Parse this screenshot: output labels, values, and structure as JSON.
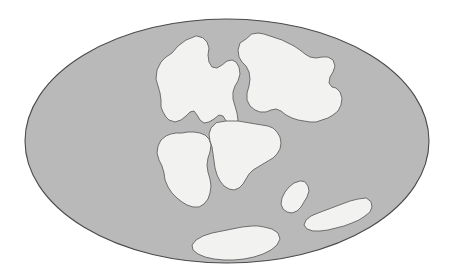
{
  "figure": {
    "caption": "",
    "projection": "elliptical (Mollweide-style) world projection",
    "width": 453,
    "height": 276
  },
  "colors": {
    "page_background": "#ffffff",
    "ocean_fill": "#b9b9b9",
    "ocean_outline": "#4a4a4a",
    "land_fill": "#f2f2f0",
    "land_outline": "#6e6e6e"
  },
  "style": {
    "ocean_stroke_width": 1.1,
    "land_stroke_width": 1.0
  },
  "map": {
    "ocean": {
      "name": "world-ocean",
      "label": "Ocean",
      "ellipse": {
        "cx": 227,
        "cy": 141,
        "rx": 202,
        "ry": 122
      }
    },
    "landmasses": [
      {
        "id": "laurentia-north-america",
        "label": "North America (Laurentia)",
        "path": "M 196 36 L 186 40 L 178 46 L 172 53 L 166 57 L 161 62 L 157 70 L 156 79 L 158 86 L 160 93 L 161 100 L 161 107 L 163 112 L 166 117 L 169 120 L 175 122 L 181 120 L 186 116 L 190 112 L 194 111 L 197 115 L 200 120 L 204 123 L 209 122 L 214 119 L 219 115 L 223 116 L 226 121 L 231 124 L 236 125 L 238 120 L 237 113 L 235 106 L 233 99 L 233 92 L 235 86 L 238 81 L 240 74 L 239 67 L 236 62 L 232 60 L 227 61 L 222 65 L 217 68 L 212 67 L 209 62 L 208 55 L 209 48 L 207 42 L 203 38 Z"
      },
      {
        "id": "eurasia-laurasia",
        "label": "Eurasia (Laurasia)",
        "path": "M 246 39 L 240 43 L 238 50 L 239 57 L 242 62 L 246 66 L 249 72 L 250 79 L 249 86 L 247 93 L 247 100 L 250 106 L 255 110 L 260 112 L 266 112 L 271 110 L 276 109 L 281 111 L 286 115 L 292 118 L 298 120 L 304 121 L 310 122 L 316 122 L 322 120 L 328 118 L 333 115 L 338 111 L 341 105 L 342 98 L 340 92 L 336 88 L 332 87 L 329 83 L 330 77 L 333 72 L 335 66 L 333 60 L 328 57 L 322 57 L 316 58 L 310 57 L 305 54 L 300 50 L 294 46 L 288 43 L 282 40 L 276 38 L 270 36 L 264 34 L 258 33 L 252 34 Z"
      },
      {
        "id": "south-america-gondwana",
        "label": "South America",
        "path": "M 166 136 L 161 140 L 158 146 L 157 153 L 159 160 L 162 166 L 164 173 L 165 180 L 168 187 L 172 193 L 177 198 L 182 202 L 187 205 L 193 207 L 199 207 L 204 204 L 208 199 L 210 193 L 211 186 L 210 179 L 208 172 L 207 165 L 208 158 L 210 152 L 211 145 L 209 139 L 205 135 L 200 133 L 194 132 L 188 132 L 182 133 L 176 133 L 171 134 Z"
      },
      {
        "id": "africa-gondwana",
        "label": "Africa",
        "path": "M 216 123 L 211 128 L 209 134 L 210 141 L 212 147 L 213 154 L 214 161 L 215 168 L 217 175 L 220 181 L 224 186 L 229 189 L 234 190 L 239 188 L 243 184 L 246 179 L 249 174 L 253 170 L 258 167 L 263 164 L 268 161 L 273 158 L 277 154 L 280 149 L 281 143 L 280 137 L 277 132 L 273 128 L 268 126 L 262 125 L 256 124 L 250 123 L 244 122 L 238 121 L 232 121 L 226 121 L 220 122 Z"
      },
      {
        "id": "india",
        "label": "India",
        "path": "M 300 181 L 294 183 L 289 187 L 285 192 L 282 198 L 281 204 L 283 209 L 287 212 L 292 213 L 297 211 L 301 207 L 304 202 L 307 197 L 309 191 L 308 186 L 305 182 Z"
      },
      {
        "id": "australia",
        "label": "Australia",
        "path": "M 366 198 L 358 199 L 350 201 L 342 204 L 334 207 L 326 210 L 318 213 L 311 216 L 306 220 L 304 225 L 307 229 L 313 231 L 320 231 L 328 230 L 336 228 L 344 226 L 352 223 L 359 220 L 365 216 L 370 212 L 372 207 L 371 202 Z"
      },
      {
        "id": "antarctica",
        "label": "Antarctica",
        "path": "M 252 226 L 242 227 L 232 229 L 222 231 L 212 233 L 203 236 L 196 240 L 192 245 L 193 250 L 198 254 L 205 257 L 214 259 L 224 260 L 234 260 L 244 259 L 254 257 L 263 254 L 271 250 L 277 245 L 280 239 L 278 233 L 272 229 L 264 227 L 258 226 Z"
      }
    ]
  }
}
